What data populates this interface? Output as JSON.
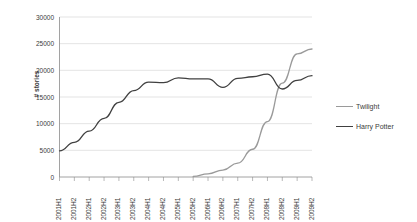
{
  "chart_data": {
    "type": "line",
    "title": "",
    "xlabel": "",
    "ylabel": "# stories",
    "ylim": [
      0,
      30000
    ],
    "ytick_labels": [
      "30000",
      "25000",
      "20000",
      "15000",
      "10000",
      "5000",
      "0"
    ],
    "yticks": [
      30000,
      25000,
      20000,
      15000,
      10000,
      5000,
      0
    ],
    "grid": true,
    "legend_position": "right",
    "categories": [
      "2001H1",
      "2001H2",
      "2002H1",
      "2002H2",
      "2003H1",
      "2003H2",
      "2004H1",
      "2004H2",
      "2005H1",
      "2005H2",
      "2006H1",
      "2006H2",
      "2007H1",
      "2007H2",
      "2008H1",
      "2008H2",
      "2009H1",
      "2009H2"
    ],
    "series": [
      {
        "name": "Twilight",
        "color": "#9a9a9a",
        "values": [
          null,
          null,
          null,
          null,
          null,
          null,
          null,
          null,
          null,
          100,
          600,
          1300,
          2600,
          5200,
          10400,
          17600,
          23100,
          24000
        ]
      },
      {
        "name": "Harry Potter",
        "color": "#404040",
        "values": [
          4900,
          6500,
          8600,
          11000,
          14000,
          16200,
          17800,
          17700,
          18600,
          18400,
          18400,
          16800,
          18500,
          18800,
          19300,
          16500,
          18100,
          19000
        ]
      }
    ]
  },
  "legend": {
    "items": [
      {
        "label": "Twilight",
        "color": "#9a9a9a"
      },
      {
        "label": "Harry Potter",
        "color": "#404040"
      }
    ]
  }
}
